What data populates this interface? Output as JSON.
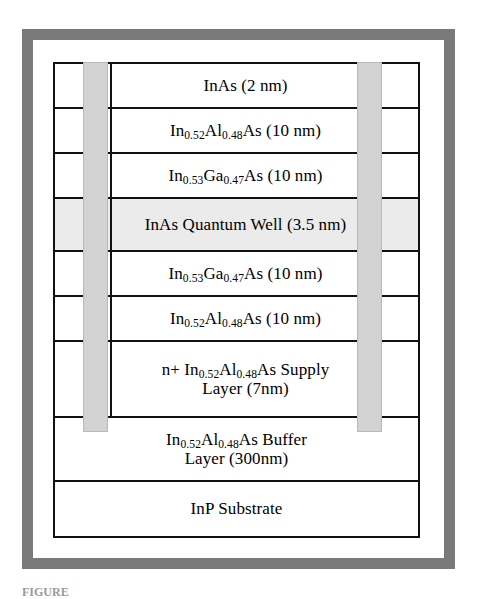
{
  "figure": {
    "caption": "FIGURE",
    "frame_color": "#7a7a7a",
    "line_color": "#111111",
    "contact_color": "#d2d2d2",
    "well_fill_color": "#ebebeb",
    "background_color": "#ffffff"
  },
  "diagram": {
    "type": "layer-stack-cross-section",
    "contacts": [
      {
        "name": "left-contact-bar"
      },
      {
        "name": "right-contact-bar"
      }
    ],
    "layers": [
      {
        "id": "cap-inas",
        "text": "InAs (2 nm)",
        "material": "InAs",
        "thickness": "2 nm",
        "highlight": false,
        "full_width": false
      },
      {
        "id": "inalas-barrier-top",
        "text_pre": "In",
        "sub1": "0.52",
        "text_mid": "Al",
        "sub2": "0.48",
        "text_post": "As (10 nm)",
        "material": "In0.52Al0.48As",
        "thickness": "10 nm",
        "highlight": false,
        "full_width": false
      },
      {
        "id": "ingaas-top",
        "text_pre": "In",
        "sub1": "0.53",
        "text_mid": "Ga",
        "sub2": "0.47",
        "text_post": "As (10 nm)",
        "material": "In0.53Ga0.47As",
        "thickness": "10 nm",
        "highlight": false,
        "full_width": false
      },
      {
        "id": "quantum-well",
        "text": "InAs Quantum Well (3.5 nm)",
        "material": "InAs Quantum Well",
        "thickness": "3.5 nm",
        "highlight": true,
        "full_width": false
      },
      {
        "id": "ingaas-bottom",
        "text_pre": "In",
        "sub1": "0.53",
        "text_mid": "Ga",
        "sub2": "0.47",
        "text_post": "As (10 nm)",
        "material": "In0.53Ga0.47As",
        "thickness": "10 nm",
        "highlight": false,
        "full_width": false
      },
      {
        "id": "inalas-barrier-bottom",
        "text_pre": "In",
        "sub1": "0.52",
        "text_mid": "Al",
        "sub2": "0.48",
        "text_post": "As (10 nm)",
        "material": "In0.52Al0.48As",
        "thickness": "10 nm",
        "highlight": false,
        "full_width": false
      },
      {
        "id": "supply-layer",
        "text_pre": "n+ In",
        "sub1": "0.52",
        "text_mid": "Al",
        "sub2": "0.48",
        "text_post": "As  Supply",
        "text_line2": "Layer (7nm)",
        "material": "n+ In0.52Al0.48As Supply Layer",
        "thickness": "7 nm",
        "highlight": false,
        "full_width": false
      },
      {
        "id": "buffer-layer",
        "text_pre": "In",
        "sub1": "0.52",
        "text_mid": "Al",
        "sub2": "0.48",
        "text_post": "As  Buffer",
        "text_line2": "Layer (300nm)",
        "material": "In0.52Al0.48As Buffer Layer",
        "thickness": "300 nm",
        "highlight": false,
        "full_width": true
      },
      {
        "id": "substrate",
        "text": "InP  Substrate",
        "material": "InP Substrate",
        "thickness": "",
        "highlight": false,
        "full_width": true
      }
    ]
  }
}
